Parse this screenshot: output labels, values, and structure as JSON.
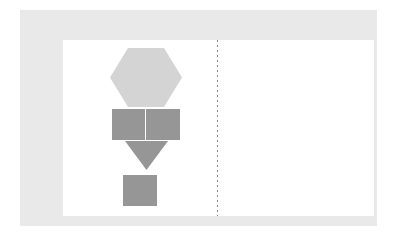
{
  "canvas": {
    "width": 403,
    "height": 243,
    "background_color": "#ffffff"
  },
  "frame": {
    "name": "outer-frame",
    "color": "#e9e9e9",
    "x": 20,
    "y": 10,
    "width": 357,
    "height": 216
  },
  "artboard": {
    "name": "inner-artboard",
    "color": "#ffffff",
    "x": 43,
    "y": 30,
    "width": 311,
    "height": 176
  },
  "divider": {
    "name": "vertical-dotted-divider",
    "style": "dotted",
    "color": "#8c8c8c",
    "x": 197,
    "y_start": 30,
    "y_end": 206,
    "thickness": 1
  },
  "shapes": [
    {
      "id": "hexagon",
      "type": "hexagon",
      "orientation": "flat-top",
      "fill": "#d4d4d4",
      "x": 90,
      "y": 38,
      "width": 72,
      "height": 59
    },
    {
      "id": "rectangle-left",
      "type": "rectangle",
      "fill": "#969696",
      "x": 92,
      "y": 99,
      "width": 33,
      "height": 31
    },
    {
      "id": "rectangle-right",
      "type": "rectangle",
      "fill": "#969696",
      "x": 126,
      "y": 99,
      "width": 34,
      "height": 31
    },
    {
      "id": "triangle-down",
      "type": "triangle",
      "orientation": "pointing-down",
      "fill": "#969696",
      "x": 105,
      "y": 131,
      "width": 43,
      "height": 29
    },
    {
      "id": "square-bottom",
      "type": "square",
      "fill": "#969696",
      "x": 103,
      "y": 165,
      "width": 34,
      "height": 31
    }
  ]
}
